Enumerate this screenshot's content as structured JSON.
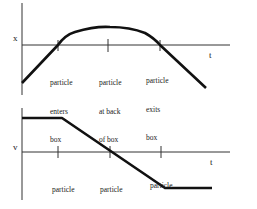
{
  "top_graph": {
    "y_label": "x",
    "x_label": "t",
    "markers": [
      {
        "line1": "particle",
        "line2": "enters",
        "line3": "box"
      },
      {
        "line1": "particle",
        "line2": "at back",
        "line3": "of box"
      },
      {
        "line1": "particle",
        "line2": "exits",
        "line3": "box"
      }
    ]
  },
  "bottom_graph": {
    "y_label": "v",
    "x_label": "t",
    "markers": [
      {
        "line1": "particle",
        "line2": "enters",
        "line3": "box"
      },
      {
        "line1": "particle",
        "line2": "at back",
        "line3": "of box"
      },
      {
        "line1": "particle",
        "line2": "exits box",
        "line3": ""
      }
    ]
  },
  "colors": {
    "line": "#111111",
    "axis": "#333333",
    "background": "#ffffff"
  }
}
